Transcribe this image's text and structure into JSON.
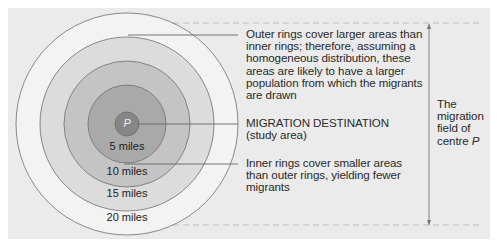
{
  "diagram": {
    "centre_label": "P",
    "rings": [
      {
        "label": "5 miles",
        "radius_miles": 5,
        "fill": "#a9a9a9"
      },
      {
        "label": "10 miles",
        "radius_miles": 10,
        "fill": "#c4c4c4"
      },
      {
        "label": "15 miles",
        "radius_miles": 15,
        "fill": "#dcdcdc"
      },
      {
        "label": "20 miles",
        "radius_miles": 20,
        "fill": "#f3f3f3"
      }
    ],
    "centre_fill": "#868686",
    "annotations": {
      "outer": "Outer rings cover larger areas than inner rings; therefore, assuming a homogeneous distribution, these areas are likely to have a larger population from which the migrants are drawn",
      "destination_line1": "MIGRATION DESTINATION",
      "destination_line2": "(study area)",
      "inner": "Inner rings cover smaller areas than outer rings, yielding fewer migrants"
    },
    "field_label": {
      "line1": "The",
      "line2": "migration",
      "line3": "field of",
      "line4": "centre",
      "italic": "P"
    },
    "colors": {
      "background": "#ebebeb",
      "stroke": "#6e6e6e",
      "text": "#2a2a2a"
    }
  }
}
